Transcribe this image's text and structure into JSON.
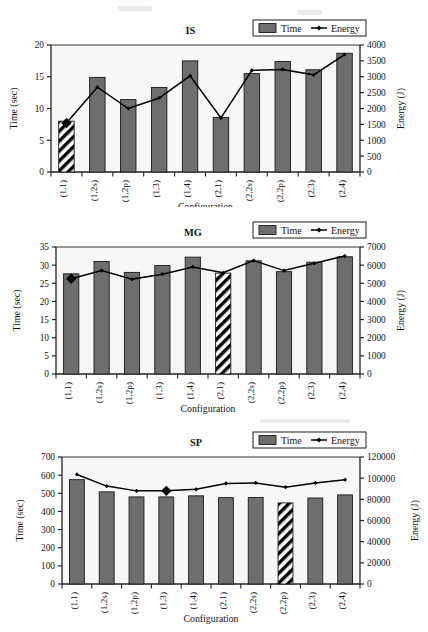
{
  "figure": {
    "background": "#ffffff",
    "bar_fill": "#6e6e6e",
    "bar_edge": "#1a1a1a",
    "line_color": "#000000",
    "plot_bg": "#f7f7f5",
    "hatch_color": "#000000",
    "panels_count": 3
  },
  "legend": {
    "time_label": "Time",
    "energy_label": "Energy",
    "swatch_icon": "filled-square-icon",
    "line_icon": "line-marker-icon"
  },
  "axis_common": {
    "xlabel": "Configuration",
    "ylabel_left": "Time (sec)",
    "ylabel_right": "Energy (J)",
    "categories": [
      "(1,1)",
      "(1,2s)",
      "(1,2p)",
      "(1,3)",
      "(1,4)",
      "(2,1)",
      "(2,2s)",
      "(2,2p)",
      "(2,3)",
      "(2,4)"
    ]
  },
  "chart_data": [
    {
      "type": "bar",
      "title": "IS",
      "xlabel": "Configuration",
      "ylabel": "Time (sec)",
      "ylabel_right": "Energy (J)",
      "categories": [
        "(1,1)",
        "(1,2s)",
        "(1,2p)",
        "(1,3)",
        "(1,4)",
        "(2,1)",
        "(2,2s)",
        "(2,2p)",
        "(2,3)",
        "(2,4)"
      ],
      "ylim": [
        0,
        20
      ],
      "yticks": [
        0,
        5,
        10,
        15,
        20
      ],
      "ylim_right": [
        0,
        4000
      ],
      "yticks_right": [
        0,
        500,
        1000,
        1500,
        2000,
        2500,
        3000,
        3500,
        4000
      ],
      "grid": false,
      "legend_position": "top-right",
      "series": [
        {
          "name": "Time",
          "kind": "bar",
          "axis": "left",
          "units": "sec",
          "values": [
            8.0,
            14.9,
            11.4,
            13.3,
            17.5,
            8.6,
            15.5,
            17.4,
            16.1,
            18.7
          ],
          "highlight_index": 0,
          "highlight_style": "diagonal-hatch"
        },
        {
          "name": "Energy",
          "kind": "line",
          "axis": "right",
          "units": "J",
          "values": [
            1540,
            2670,
            2000,
            2330,
            3030,
            1700,
            3200,
            3230,
            3060,
            3700
          ],
          "marker": "diamond",
          "highlight_index": 0,
          "highlight_marker": "large-diamond"
        }
      ]
    },
    {
      "type": "bar",
      "title": "MG",
      "xlabel": "Configuration",
      "ylabel": "Time (sec)",
      "ylabel_right": "Energy (J)",
      "categories": [
        "(1,1)",
        "(1,2s)",
        "(1,2p)",
        "(1,3)",
        "(1,4)",
        "(2,1)",
        "(2,2s)",
        "(2,2p)",
        "(2,3)",
        "(2,4)"
      ],
      "ylim": [
        0,
        35
      ],
      "yticks": [
        0,
        5,
        10,
        15,
        20,
        25,
        30,
        35
      ],
      "ylim_right": [
        0,
        7000
      ],
      "yticks_right": [
        0,
        1000,
        2000,
        3000,
        4000,
        5000,
        6000,
        7000
      ],
      "grid": false,
      "legend_position": "top-right",
      "series": [
        {
          "name": "Time",
          "kind": "bar",
          "axis": "left",
          "units": "sec",
          "values": [
            27.6,
            31.0,
            28.0,
            29.9,
            32.2,
            27.8,
            31.2,
            28.2,
            30.8,
            32.3
          ],
          "highlight_index": 5,
          "highlight_style": "diagonal-hatch"
        },
        {
          "name": "Energy",
          "kind": "line",
          "axis": "right",
          "units": "J",
          "values": [
            5250,
            5700,
            5230,
            5500,
            5900,
            5580,
            6250,
            5700,
            6100,
            6500
          ],
          "marker": "diamond",
          "highlight_index": 0,
          "highlight_marker": "large-diamond"
        }
      ]
    },
    {
      "type": "bar",
      "title": "SP",
      "xlabel": "Configuration",
      "ylabel": "Time (sec)",
      "ylabel_right": "Energy (J)",
      "categories": [
        "(1,1)",
        "(1,2s)",
        "(1,2p)",
        "(1,3)",
        "(1,4)",
        "(2,1)",
        "(2,2s)",
        "(2,2p)",
        "(2,3)",
        "(2,4)"
      ],
      "ylim": [
        0,
        700
      ],
      "yticks": [
        0,
        100,
        200,
        300,
        400,
        500,
        600,
        700
      ],
      "ylim_right": [
        0,
        120000
      ],
      "yticks_right": [
        0,
        20000,
        40000,
        60000,
        80000,
        100000,
        120000
      ],
      "grid": false,
      "legend_position": "top-right",
      "series": [
        {
          "name": "Time",
          "kind": "bar",
          "axis": "left",
          "units": "sec",
          "values": [
            575,
            508,
            480,
            480,
            486,
            476,
            477,
            447,
            474,
            491
          ],
          "highlight_index": 7,
          "highlight_style": "diagonal-hatch"
        },
        {
          "name": "Energy",
          "kind": "line",
          "axis": "right",
          "units": "J",
          "values": [
            103500,
            92500,
            88000,
            88000,
            89500,
            95000,
            95500,
            91500,
            95500,
            98500
          ],
          "marker": "diamond",
          "highlight_index": 3,
          "highlight_marker": "large-diamond"
        }
      ]
    }
  ]
}
